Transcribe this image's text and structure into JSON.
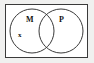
{
  "figure": {
    "kind": "venn-diagram",
    "title": "",
    "background_color": "#f0f0ef",
    "inner_background_color": "#ffffff",
    "stroke_color": "#3a3a3a",
    "label_color": "#111111"
  },
  "universal_set": {
    "shape": "rectangle",
    "label": ""
  },
  "sets": [
    {
      "id": "left",
      "label": "M",
      "shape": "circle",
      "cx": 32,
      "cy": 31,
      "r": 22
    },
    {
      "id": "right",
      "label": "P",
      "shape": "circle",
      "cx": 61,
      "cy": 31,
      "r": 22
    }
  ],
  "elements": [
    {
      "id": "x",
      "label": "x",
      "region": "left-only",
      "x": 21,
      "y": 38
    }
  ]
}
